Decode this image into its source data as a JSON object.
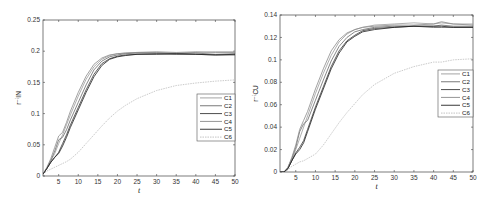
{
  "chart_data": [
    {
      "type": "line",
      "title": "",
      "xlabel": "t",
      "ylabel": "r⁻ⁱIN",
      "xlim": [
        1,
        50
      ],
      "ylim": [
        0,
        0.25
      ],
      "xticks": [
        5,
        10,
        15,
        20,
        25,
        30,
        35,
        40,
        45,
        50
      ],
      "yticks": [
        0,
        0.05,
        0.1,
        0.15,
        0.2,
        0.25
      ],
      "ytick_labels": [
        "0",
        "0.05",
        "0.1",
        "0.15",
        "0.2",
        "0.25"
      ],
      "grid": false,
      "legend_position": "right-middle",
      "x": [
        1,
        2,
        3,
        4,
        5,
        6,
        7,
        8,
        10,
        12,
        14,
        16,
        18,
        20,
        22,
        25,
        30,
        35,
        40,
        45,
        50
      ],
      "series": [
        {
          "name": "C1",
          "color": "#9a9a9a",
          "values": [
            0.003,
            0.012,
            0.024,
            0.036,
            0.052,
            0.066,
            0.082,
            0.098,
            0.128,
            0.155,
            0.175,
            0.187,
            0.193,
            0.196,
            0.197,
            0.198,
            0.198,
            0.197,
            0.198,
            0.199,
            0.199
          ]
        },
        {
          "name": "C2",
          "color": "#6a6a6a",
          "values": [
            0.003,
            0.013,
            0.025,
            0.04,
            0.058,
            0.062,
            0.074,
            0.09,
            0.118,
            0.146,
            0.17,
            0.184,
            0.191,
            0.194,
            0.196,
            0.197,
            0.197,
            0.196,
            0.197,
            0.195,
            0.196
          ]
        },
        {
          "name": "C3",
          "color": "#3a3a3a",
          "values": [
            0.003,
            0.012,
            0.022,
            0.03,
            0.038,
            0.052,
            0.066,
            0.082,
            0.11,
            0.138,
            0.163,
            0.18,
            0.188,
            0.192,
            0.194,
            0.195,
            0.196,
            0.195,
            0.195,
            0.194,
            0.194
          ]
        },
        {
          "name": "C4",
          "color": "#8a8a8a",
          "values": [
            0.003,
            0.014,
            0.028,
            0.046,
            0.064,
            0.07,
            0.086,
            0.104,
            0.134,
            0.16,
            0.179,
            0.189,
            0.194,
            0.196,
            0.197,
            0.198,
            0.199,
            0.198,
            0.199,
            0.198,
            0.198
          ]
        },
        {
          "name": "C5",
          "color": "#222222",
          "values": [
            0.003,
            0.012,
            0.022,
            0.03,
            0.036,
            0.048,
            0.062,
            0.078,
            0.106,
            0.134,
            0.159,
            0.177,
            0.187,
            0.191,
            0.193,
            0.195,
            0.195,
            0.196,
            0.195,
            0.194,
            0.195
          ]
        },
        {
          "name": "C6",
          "color": "#bdbdbd",
          "dashed": true,
          "values": [
            0.003,
            0.008,
            0.011,
            0.014,
            0.017,
            0.02,
            0.023,
            0.027,
            0.038,
            0.052,
            0.066,
            0.08,
            0.093,
            0.104,
            0.113,
            0.124,
            0.137,
            0.145,
            0.149,
            0.152,
            0.154
          ]
        }
      ]
    },
    {
      "type": "line",
      "title": "",
      "xlabel": "t",
      "ylabel": "r⁻ⁱCU",
      "xlim": [
        1,
        50
      ],
      "ylim": [
        0,
        0.14
      ],
      "xticks": [
        5,
        10,
        15,
        20,
        25,
        30,
        35,
        40,
        45,
        50
      ],
      "yticks": [
        0,
        0.02,
        0.04,
        0.06,
        0.08,
        0.1,
        0.12,
        0.14
      ],
      "ytick_labels": [
        "0",
        "0.02",
        "0.04",
        "0.06",
        "0.08",
        "0.1",
        "0.12",
        "0.14"
      ],
      "grid": false,
      "legend_position": "right-middle",
      "x": [
        1,
        2,
        3,
        4,
        5,
        6,
        7,
        8,
        10,
        12,
        14,
        16,
        18,
        20,
        22,
        25,
        30,
        35,
        40,
        42,
        45,
        50
      ],
      "series": [
        {
          "name": "C1",
          "color": "#9a9a9a",
          "values": [
            0.0,
            0.0,
            0.003,
            0.01,
            0.02,
            0.03,
            0.04,
            0.05,
            0.07,
            0.088,
            0.104,
            0.116,
            0.123,
            0.127,
            0.129,
            0.131,
            0.132,
            0.133,
            0.132,
            0.133,
            0.132,
            0.132
          ]
        },
        {
          "name": "C2",
          "color": "#6a6a6a",
          "values": [
            0.0,
            0.0,
            0.004,
            0.012,
            0.022,
            0.036,
            0.043,
            0.046,
            0.064,
            0.082,
            0.099,
            0.112,
            0.12,
            0.125,
            0.127,
            0.129,
            0.13,
            0.13,
            0.13,
            0.131,
            0.13,
            0.13
          ]
        },
        {
          "name": "C3",
          "color": "#3a3a3a",
          "values": [
            0.0,
            0.0,
            0.003,
            0.01,
            0.017,
            0.022,
            0.028,
            0.038,
            0.058,
            0.076,
            0.094,
            0.108,
            0.117,
            0.122,
            0.126,
            0.128,
            0.129,
            0.13,
            0.129,
            0.129,
            0.129,
            0.129
          ]
        },
        {
          "name": "C4",
          "color": "#8a8a8a",
          "values": [
            0.0,
            0.0,
            0.004,
            0.013,
            0.024,
            0.038,
            0.046,
            0.054,
            0.074,
            0.092,
            0.108,
            0.118,
            0.124,
            0.127,
            0.129,
            0.13,
            0.131,
            0.131,
            0.132,
            0.134,
            0.132,
            0.131
          ]
        },
        {
          "name": "C5",
          "color": "#222222",
          "values": [
            0.0,
            0.0,
            0.003,
            0.01,
            0.016,
            0.02,
            0.026,
            0.036,
            0.056,
            0.074,
            0.092,
            0.106,
            0.116,
            0.121,
            0.125,
            0.127,
            0.129,
            0.13,
            0.13,
            0.13,
            0.129,
            0.129
          ]
        },
        {
          "name": "C6",
          "color": "#bdbdbd",
          "dashed": true,
          "values": [
            0.0,
            0.0,
            0.002,
            0.005,
            0.007,
            0.009,
            0.01,
            0.012,
            0.016,
            0.024,
            0.034,
            0.044,
            0.053,
            0.061,
            0.069,
            0.078,
            0.088,
            0.094,
            0.098,
            0.098,
            0.1,
            0.101
          ]
        }
      ]
    }
  ],
  "panels": [
    {
      "box": {
        "left": 43,
        "top": 20,
        "right": 235,
        "bottom": 176
      },
      "legend": {
        "left": 197,
        "top": 94,
        "width": 38,
        "height": 47
      }
    },
    {
      "box": {
        "left": 280,
        "top": 15,
        "right": 473,
        "bottom": 172
      },
      "legend": {
        "left": 438,
        "top": 70,
        "width": 35,
        "height": 47
      }
    }
  ]
}
